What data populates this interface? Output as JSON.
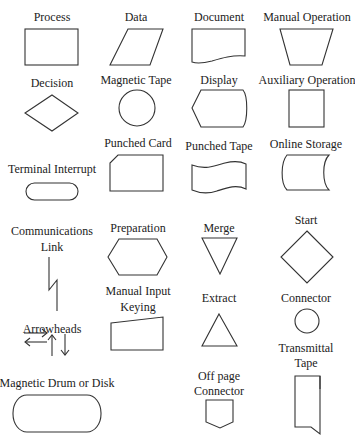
{
  "symbols": {
    "process": "Process",
    "data": "Data",
    "document": "Document",
    "manual_operation": "Manual Operation",
    "decision": "Decision",
    "magnetic_tape": "Magnetic Tape",
    "display": "Display",
    "auxiliary_operation": "Auxiliary Operation",
    "punched_card": "Punched Card",
    "punched_tape": "Punched Tape",
    "online_storage": "Online Storage",
    "terminal_interrupt": "Terminal Interrupt",
    "communications_link_1": "Communications",
    "communications_link_2": "Link",
    "preparation": "Preparation",
    "merge": "Merge",
    "start": "Start",
    "manual_input_1": "Manual Input",
    "manual_input_2": "Keying",
    "extract": "Extract",
    "connector": "Connector",
    "arrowheads": "Arrowheads",
    "transmittal_tape_1": "Transmittal",
    "transmittal_tape_2": "Tape",
    "magnetic_drum": "Magnetic Drum or Disk",
    "off_page_1": "Off page",
    "off_page_2": "Connector"
  }
}
